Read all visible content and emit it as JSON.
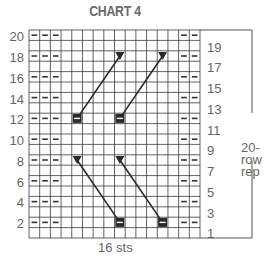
{
  "title": "CHART 4",
  "left_row_labels": [
    "20",
    "18",
    "16",
    "14",
    "12",
    "10",
    "8",
    "6",
    "4",
    "2"
  ],
  "right_row_labels": [
    "19",
    "17",
    "15",
    "13",
    "11",
    "9",
    "7",
    "5",
    "3",
    "1"
  ],
  "stitch_count_label": "16 sts",
  "repeat_label_line1": "20-row",
  "repeat_label_line2": "rep",
  "grid": {
    "columns": 16,
    "rows": 20,
    "purl_columns_left": [
      1,
      2,
      3
    ],
    "purl_columns_right": [
      15,
      16
    ],
    "purl_rows": [
      20,
      18,
      16,
      14,
      12,
      10,
      8,
      6,
      4,
      2
    ]
  },
  "cables": [
    {
      "start": {
        "row": 12,
        "col": 5
      },
      "end": {
        "row": 18,
        "col": 9
      },
      "direction": "right-lean"
    },
    {
      "start": {
        "row": 12,
        "col": 9
      },
      "end": {
        "row": 18,
        "col": 13
      },
      "direction": "right-lean"
    },
    {
      "start": {
        "row": 2,
        "col": 9
      },
      "end": {
        "row": 8,
        "col": 5
      },
      "direction": "left-lean"
    },
    {
      "start": {
        "row": 2,
        "col": 13
      },
      "end": {
        "row": 8,
        "col": 9
      },
      "direction": "left-lean"
    }
  ],
  "legend_symbols": {
    "start": "dark-box-with-bar",
    "end": "down-triangle",
    "purl": "dash"
  },
  "colors": {
    "grid_line": "#3a3a3a",
    "text": "#666666",
    "symbol": "#2a2a2a"
  }
}
